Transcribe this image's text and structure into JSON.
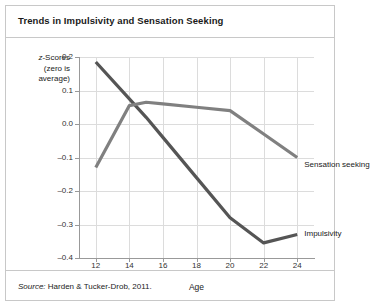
{
  "figure": {
    "title": "Trends in Impulsivity and Sensation Seeking",
    "source": "Harden & Tucker-Drob, 2011.",
    "source_label": "Source:",
    "y_axis_caption_line1": "z-Scores",
    "y_axis_caption_line2": "(zero is",
    "y_axis_caption_line3": "average)",
    "y_axis_caption_italic_char": "z",
    "y_axis_caption_rest": "-Scores"
  },
  "colors": {
    "impulsivity": "#555555",
    "sensation_seeking": "#808080",
    "grid": "#dcdcdc",
    "axis": "#999999",
    "border": "#c8c8c8",
    "text": "#1a1a1a"
  },
  "chart_data": {
    "type": "line",
    "title": "Trends in Impulsivity and Sensation Seeking",
    "xlabel": "Age",
    "ylabel": "z-Scores (zero is average)",
    "xlim": [
      11,
      25
    ],
    "ylim": [
      -0.4,
      0.2
    ],
    "xticks": [
      12,
      14,
      16,
      18,
      20,
      22,
      24
    ],
    "xtick_labels": [
      "12",
      "14",
      "16",
      "18",
      "20",
      "22",
      "24"
    ],
    "yticks": [
      0.2,
      0.1,
      0.0,
      -0.1,
      -0.2,
      -0.3,
      -0.4
    ],
    "ytick_labels": [
      "0.2",
      "0.1",
      "0.0",
      "-0.1",
      "-0.2",
      "-0.3",
      "-0.4"
    ],
    "grid": true,
    "legend_position": "inline-right-of-line-end",
    "x": [
      12,
      14,
      15,
      16,
      18,
      20,
      22,
      24
    ],
    "series": [
      {
        "name": "Impulsivity",
        "color": "#555555",
        "values": [
          0.185,
          0.075,
          0.02,
          -0.04,
          -0.16,
          -0.28,
          -0.355,
          -0.33
        ],
        "label_anchor": {
          "x": 24.3,
          "y": -0.325
        }
      },
      {
        "name": "Sensation seeking",
        "color": "#808080",
        "values": [
          -0.13,
          0.055,
          0.065,
          0.06,
          0.05,
          0.04,
          -0.03,
          -0.1
        ],
        "label_anchor": {
          "x": 24.3,
          "y": -0.118
        }
      }
    ]
  }
}
